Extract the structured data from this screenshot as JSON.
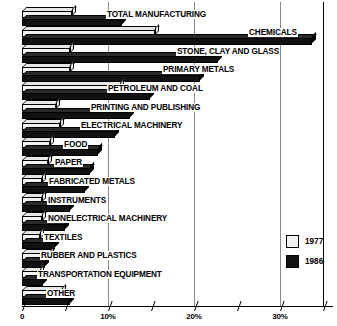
{
  "chart_data": {
    "type": "bar",
    "orientation": "horizontal",
    "title": "",
    "subtitle": "",
    "xlabel": "",
    "ylabel": "",
    "xlim": [
      0,
      36
    ],
    "grid": true,
    "legend_position": "right-lower",
    "categories": [
      "TOTAL MANUFACTURING",
      "CHEMICALS",
      "STONE, CLAY AND GLASS",
      "PRIMARY METALS",
      "PETROLEUM AND COAL",
      "PRINTING AND PUBLISHING",
      "ELECTRICAL MACHINERY",
      "FOOD",
      "PAPER",
      "FABRICATED METALS",
      "INSTRUMENTS",
      "NONELECTRICAL MACHINERY",
      "TEXTILES",
      "RUBBER AND PLASTICS",
      "TRANSPORTATION EQUIPMENT",
      "OTHER"
    ],
    "series": [
      {
        "name": "1977",
        "color": "#f2f2f2",
        "values": [
          5.8,
          15.5,
          5.6,
          5.6,
          11.4,
          3.9,
          4.4,
          3.3,
          3.0,
          2.3,
          2.3,
          2.3,
          2.1,
          3.3,
          2.1,
          4.7
        ]
      },
      {
        "name": "1986",
        "color": "#111111",
        "values": [
          11.6,
          33.7,
          22.8,
          20.7,
          14.9,
          12.6,
          10.8,
          8.8,
          7.9,
          7.3,
          5.6,
          5.0,
          3.8,
          2.7,
          2.4,
          5.6
        ]
      }
    ],
    "x_ticks": [
      {
        "value": 0,
        "label": "0"
      },
      {
        "value": 5,
        "label": ""
      },
      {
        "value": 10,
        "label": "10%"
      },
      {
        "value": 15,
        "label": ""
      },
      {
        "value": 20,
        "label": "20%"
      },
      {
        "value": 25,
        "label": ""
      },
      {
        "value": 30,
        "label": "30%"
      },
      {
        "value": 35,
        "label": ""
      }
    ],
    "gridline_values": [
      10,
      20,
      30
    ]
  },
  "legend": {
    "entries": [
      {
        "label": "1977",
        "swatch": "swatch-1977"
      },
      {
        "label": "1986",
        "swatch": "swatch-1986"
      }
    ]
  }
}
